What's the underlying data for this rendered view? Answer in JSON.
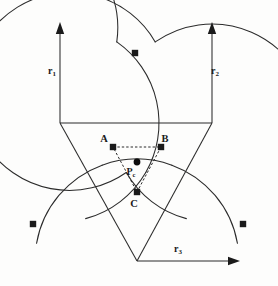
{
  "figure": {
    "kind": "geometric-construction-diagram",
    "background_color": "#fdfdfc",
    "ink_color": "#2b2b2b",
    "nodes": [
      {
        "id": "A",
        "label": "A",
        "x": 113,
        "y": 147,
        "label_x": 104,
        "label_y": 142
      },
      {
        "id": "B",
        "label": "B",
        "x": 161,
        "y": 147,
        "label_x": 165,
        "label_y": 142
      },
      {
        "id": "C",
        "label": "C",
        "x": 137,
        "y": 192,
        "label_x": 134,
        "label_y": 207
      }
    ],
    "center_point": {
      "id": "Pc",
      "label_main": "P",
      "label_sub": "c",
      "x": 137,
      "y": 162,
      "label_x": 131,
      "label_y": 175
    },
    "radii": [
      {
        "id": "r1",
        "label_main": "r",
        "label_sub": "1",
        "label_x": 52,
        "label_y": 74,
        "from_x": 60,
        "from_y": 123,
        "to_x": 60,
        "to_y": 24,
        "direction": "up"
      },
      {
        "id": "r2",
        "label_main": "r",
        "label_sub": "2",
        "label_x": 215,
        "label_y": 74,
        "from_x": 212,
        "from_y": 123,
        "to_x": 212,
        "to_y": 24,
        "direction": "up"
      },
      {
        "id": "r3",
        "label_main": "r",
        "label_sub": "3",
        "label_x": 178,
        "label_y": 252,
        "from_x": 137,
        "from_y": 261,
        "to_x": 239,
        "to_y": 261,
        "direction": "right"
      }
    ],
    "arc_intersection_dots": [
      {
        "x": 135,
        "y": 53
      },
      {
        "x": 33,
        "y": 224
      },
      {
        "x": 243,
        "y": 224
      }
    ],
    "arcs": [
      {
        "id": "arc-r1",
        "center_x": 60,
        "center_y": 123,
        "radius": 99,
        "note": "upper-left circle centered at r1 origin"
      },
      {
        "id": "arc-r2",
        "center_x": 212,
        "center_y": 123,
        "radius": 99,
        "note": "upper-right circle centered at r2 origin"
      },
      {
        "id": "arc-r3",
        "center_x": 137,
        "center_y": 261,
        "radius": 102,
        "note": "lower circle centered at r3 origin"
      }
    ],
    "straight_segments": [
      {
        "id": "top-chord",
        "x1": 60,
        "y1": 123,
        "x2": 212,
        "y2": 123
      },
      {
        "id": "left-leg",
        "x1": 60,
        "y1": 123,
        "x2": 137,
        "y2": 261
      },
      {
        "id": "right-leg",
        "x1": 212,
        "y1": 123,
        "x2": 137,
        "y2": 261
      }
    ]
  }
}
